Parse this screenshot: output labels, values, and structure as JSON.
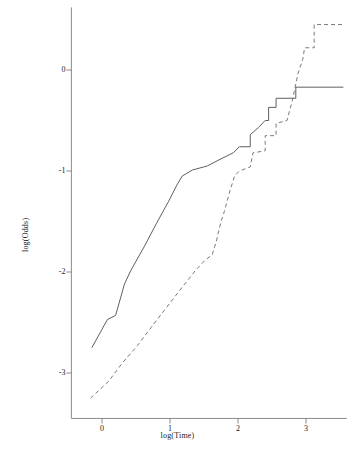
{
  "chart_data": {
    "type": "line",
    "title": "",
    "xlabel": "log(Time)",
    "ylabel": "log(Odds)",
    "xlim": [
      -0.45,
      3.6
    ],
    "ylim": [
      -3.45,
      0.62
    ],
    "xticks": [
      0,
      1,
      2,
      3
    ],
    "xticklabels": [
      "0",
      "1",
      "2",
      "3"
    ],
    "yticks": [
      0,
      -1,
      -2,
      -3
    ],
    "yticklabels": [
      "0",
      "-1",
      "-2",
      "-3"
    ],
    "grid": false,
    "legend": "none",
    "series": [
      {
        "name": "solid-curve",
        "linestyle": "solid",
        "color": "#4d4d4d",
        "points": [
          [
            -0.15,
            -2.75
          ],
          [
            0.08,
            -2.47
          ],
          [
            0.2,
            -2.43
          ],
          [
            0.33,
            -2.12
          ],
          [
            0.42,
            -1.99
          ],
          [
            0.62,
            -1.75
          ],
          [
            0.8,
            -1.52
          ],
          [
            0.98,
            -1.3
          ],
          [
            1.1,
            -1.14
          ],
          [
            1.18,
            -1.05
          ],
          [
            1.33,
            -0.99
          ],
          [
            1.55,
            -0.95
          ],
          [
            1.72,
            -0.89
          ],
          [
            1.93,
            -0.82
          ],
          [
            2.02,
            -0.76
          ],
          [
            2.18,
            -0.76
          ],
          [
            2.18,
            -0.64
          ],
          [
            2.3,
            -0.57
          ],
          [
            2.4,
            -0.5
          ],
          [
            2.45,
            -0.5
          ],
          [
            2.45,
            -0.37
          ],
          [
            2.56,
            -0.37
          ],
          [
            2.56,
            -0.28
          ],
          [
            2.85,
            -0.28
          ],
          [
            2.85,
            -0.17
          ],
          [
            3.55,
            -0.17
          ]
        ]
      },
      {
        "name": "dashed-curve",
        "linestyle": "dashed",
        "color": "#6b6b6b",
        "points": [
          [
            -0.17,
            -3.25
          ],
          [
            0.1,
            -3.08
          ],
          [
            0.3,
            -2.9
          ],
          [
            0.52,
            -2.73
          ],
          [
            0.72,
            -2.55
          ],
          [
            0.95,
            -2.35
          ],
          [
            1.18,
            -2.15
          ],
          [
            1.38,
            -1.98
          ],
          [
            1.52,
            -1.88
          ],
          [
            1.62,
            -1.83
          ],
          [
            1.68,
            -1.7
          ],
          [
            1.75,
            -1.5
          ],
          [
            1.8,
            -1.4
          ],
          [
            1.88,
            -1.2
          ],
          [
            1.95,
            -1.05
          ],
          [
            2.02,
            -1.0
          ],
          [
            2.18,
            -0.96
          ],
          [
            2.22,
            -0.82
          ],
          [
            2.4,
            -0.8
          ],
          [
            2.4,
            -0.65
          ],
          [
            2.56,
            -0.65
          ],
          [
            2.56,
            -0.53
          ],
          [
            2.72,
            -0.5
          ],
          [
            2.8,
            -0.3
          ],
          [
            2.88,
            -0.04
          ],
          [
            2.95,
            0.1
          ],
          [
            2.98,
            0.22
          ],
          [
            3.12,
            0.22
          ],
          [
            3.12,
            0.45
          ],
          [
            3.55,
            0.45
          ]
        ]
      }
    ],
    "axes": {
      "x_axis_line": {
        "from": -0.45,
        "to": 3.6,
        "at_y": -3.45
      },
      "y_axis_line": {
        "from": -3.45,
        "to": 0.62,
        "at_x": -0.45
      }
    }
  }
}
